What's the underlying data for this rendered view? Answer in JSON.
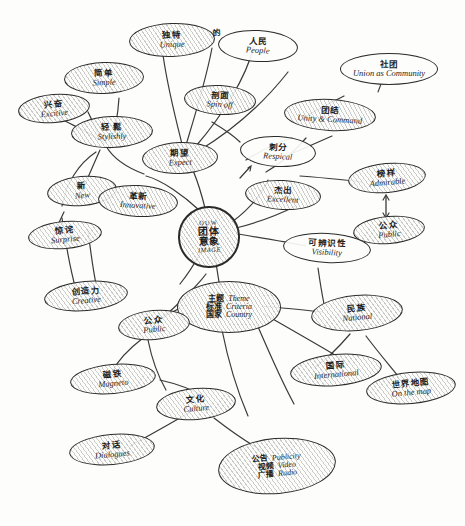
{
  "diagram": {
    "medium": "hand-drawn pencil sketch",
    "ink_color": "#2b2b2b",
    "paper_color": "#fdfdfc"
  },
  "center": {
    "top_label": "OUW",
    "cn": "团体",
    "cn2": "意象",
    "en": "IMAGE"
  },
  "nodes": [
    {
      "id": "unique",
      "cn": "独特",
      "en": "Unique",
      "shaded": true
    },
    {
      "id": "people",
      "cn": "人民",
      "en": "People",
      "shaded": false
    },
    {
      "id": "people_de",
      "cn": "的",
      "en": "",
      "shaded": false
    },
    {
      "id": "simple",
      "cn": "简单",
      "en": "Simple",
      "shaded": true
    },
    {
      "id": "excitive",
      "cn": "兴奋",
      "en": "Excitive",
      "shaded": true
    },
    {
      "id": "stylishly",
      "cn": "轻 鬆",
      "en": "Stylishly",
      "shaded": true
    },
    {
      "id": "spin_off",
      "cn": "剖面",
      "en": "Spin off",
      "shaded": true
    },
    {
      "id": "expect",
      "cn": "期望",
      "en": "Expect",
      "shaded": true
    },
    {
      "id": "new",
      "cn": "新",
      "en": "New",
      "shaded": true
    },
    {
      "id": "innovative",
      "cn": "革新",
      "en": "Innovative",
      "shaded": true
    },
    {
      "id": "surprise",
      "cn": "惊诧",
      "en": "Surprise",
      "shaded": true
    },
    {
      "id": "creative",
      "cn": "创造力",
      "en": "Creative",
      "shaded": true
    },
    {
      "id": "unity",
      "cn": "团结",
      "en": "Unity & Command",
      "shaded": true
    },
    {
      "id": "union",
      "cn": "社团",
      "en": "Union as Community",
      "shaded": false
    },
    {
      "id": "respect",
      "cn": "刺分",
      "en": "Respical",
      "shaded": true
    },
    {
      "id": "excellent",
      "cn": "杰出",
      "en": "Excellent",
      "shaded": true
    },
    {
      "id": "admirable",
      "cn": "榜样",
      "en": "Admirable",
      "shaded": true
    },
    {
      "id": "public_right",
      "cn": "公众",
      "en": "Public",
      "shaded": true
    },
    {
      "id": "visibility",
      "cn": "可辨识性",
      "en": "Visibility",
      "shaded": false
    },
    {
      "id": "public_left",
      "cn": "公众",
      "en": "Public",
      "shaded": true
    },
    {
      "id": "national",
      "cn": "民族",
      "en": "National",
      "shaded": true
    },
    {
      "id": "international",
      "cn": "国际",
      "en": "International",
      "shaded": true
    },
    {
      "id": "on_the_map",
      "cn": "世界地图",
      "en": "On the map",
      "shaded": true
    },
    {
      "id": "magneto",
      "cn": "磁铁",
      "en": "Magneto",
      "shaded": true
    },
    {
      "id": "culture",
      "cn": "文化",
      "en": "Culture",
      "shaded": true
    },
    {
      "id": "dialogues",
      "cn": "对话",
      "en": "Dialogues",
      "shaded": true
    }
  ],
  "theme_node": {
    "id": "theme_criteria_country",
    "shaded": true,
    "rows": [
      {
        "cn": "主题",
        "en": "Theme"
      },
      {
        "cn": "标准",
        "en": "Criteria"
      },
      {
        "cn": "国家",
        "en": "Country"
      }
    ]
  },
  "media_node": {
    "id": "publicity_video_radio",
    "shaded": true,
    "rows": [
      {
        "cn": "公告",
        "en": "Publicity"
      },
      {
        "cn": "视频",
        "en": "Video"
      },
      {
        "cn": "广播",
        "en": "Radio"
      }
    ]
  },
  "annotations": {
    "double_arrow_label": "admirable-public-double-arrow"
  }
}
